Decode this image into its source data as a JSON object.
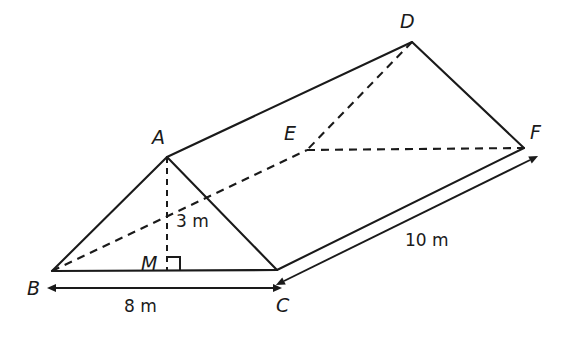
{
  "figure": {
    "type": "triangular-prism-diagram",
    "background_color": "#ffffff",
    "stroke_color": "#1a1a1a",
    "vertices": [
      {
        "name": "A",
        "label": "A",
        "x": 167,
        "y": 157,
        "label_x": 152,
        "label_y": 128,
        "hidden": false
      },
      {
        "name": "B",
        "label": "B",
        "x": 52,
        "y": 271,
        "label_x": 27,
        "label_y": 279,
        "hidden": false
      },
      {
        "name": "C",
        "label": "C",
        "x": 277,
        "y": 270,
        "label_x": 276,
        "label_y": 296,
        "hidden": false
      },
      {
        "name": "D",
        "label": "D",
        "x": 412,
        "y": 42,
        "label_x": 400,
        "label_y": 12,
        "hidden": false
      },
      {
        "name": "E",
        "label": "E",
        "x": 307,
        "y": 150,
        "label_x": 284,
        "label_y": 124,
        "hidden": true
      },
      {
        "name": "F",
        "label": "F",
        "x": 524,
        "y": 148,
        "label_x": 530,
        "label_y": 123,
        "hidden": false
      },
      {
        "name": "M",
        "label": "M",
        "x": 167,
        "y": 270,
        "label_x": 141,
        "label_y": 254,
        "hidden": false
      }
    ],
    "solid_edges": [
      {
        "name": "edge-AB",
        "from": "A",
        "to": "B"
      },
      {
        "name": "edge-AC",
        "from": "A",
        "to": "C"
      },
      {
        "name": "edge-BC",
        "from": "B",
        "to": "C"
      },
      {
        "name": "edge-AD",
        "from": "A",
        "to": "D"
      },
      {
        "name": "edge-CF",
        "from": "C",
        "to": "F"
      },
      {
        "name": "edge-DF",
        "from": "D",
        "to": "F"
      }
    ],
    "hidden_edges": [
      {
        "name": "edge-BE",
        "from": "B",
        "to": "E"
      },
      {
        "name": "edge-DE",
        "from": "D",
        "to": "E"
      },
      {
        "name": "edge-EF",
        "from": "E",
        "to": "F"
      }
    ],
    "height_segment": {
      "name": "segment-AM",
      "from": "A",
      "to": "M",
      "style": "dashed"
    },
    "right_angle": {
      "name": "right-angle-at-M",
      "at": "M",
      "size": 13
    },
    "dimensions": [
      {
        "name": "dimension-base-BC",
        "label": "8 m",
        "label_x": 124,
        "label_y": 298,
        "x1": 56,
        "y1": 288,
        "x2": 273,
        "y2": 288,
        "arrows": "both"
      },
      {
        "name": "dimension-length-CF",
        "label": "10 m",
        "label_x": 405,
        "label_y": 232,
        "x1": 284,
        "y1": 281,
        "x2": 530,
        "y2": 160,
        "arrows": "both"
      },
      {
        "name": "dimension-height-AM",
        "label": "3 m",
        "label_x": 176,
        "label_y": 213,
        "arrows": "none"
      }
    ]
  }
}
